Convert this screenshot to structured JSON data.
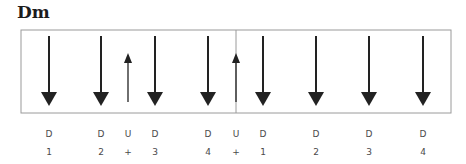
{
  "title": "Dm",
  "strum": {
    "box": {
      "x": 21,
      "y": 30,
      "width": 430,
      "height": 83,
      "stroke": "#9a9a9a"
    },
    "barline_x": 236,
    "arrow_color": "#222222",
    "beats": [
      {
        "x": 49,
        "direction": "down",
        "stroke": "D",
        "count": "1"
      },
      {
        "x": 101,
        "direction": "down",
        "stroke": "D",
        "count": "2"
      },
      {
        "x": 128,
        "direction": "up",
        "stroke": "U",
        "count": "+"
      },
      {
        "x": 155,
        "direction": "down",
        "stroke": "D",
        "count": "3"
      },
      {
        "x": 208,
        "direction": "down",
        "stroke": "D",
        "count": "4"
      },
      {
        "x": 236,
        "direction": "up",
        "stroke": "U",
        "count": "+"
      },
      {
        "x": 263,
        "direction": "down",
        "stroke": "D",
        "count": "1"
      },
      {
        "x": 316,
        "direction": "down",
        "stroke": "D",
        "count": "2"
      },
      {
        "x": 369,
        "direction": "down",
        "stroke": "D",
        "count": "3"
      },
      {
        "x": 423,
        "direction": "down",
        "stroke": "D",
        "count": "4"
      }
    ]
  }
}
